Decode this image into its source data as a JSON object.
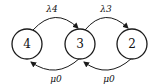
{
  "diagram": {
    "type": "state-transition",
    "nodes": [
      {
        "id": "4",
        "label": "4"
      },
      {
        "id": "3",
        "label": "3"
      },
      {
        "id": "2",
        "label": "2"
      }
    ],
    "edges": [
      {
        "from": "4",
        "to": "3",
        "label": "λ4",
        "position": "top"
      },
      {
        "from": "3",
        "to": "2",
        "label": "λ3",
        "position": "top"
      },
      {
        "from": "3",
        "to": "4",
        "label": "μ0",
        "position": "bottom"
      },
      {
        "from": "2",
        "to": "3",
        "label": "μ0",
        "position": "bottom"
      }
    ]
  }
}
